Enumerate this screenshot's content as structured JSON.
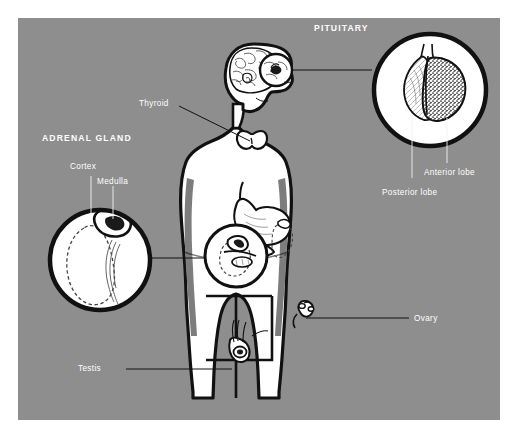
{
  "figure": {
    "panel_color": "#8e8e8e",
    "page_color": "#ffffff",
    "ink_color": "#111111",
    "label_color": "#ffffff",
    "shade_color": "#7d7d7d",
    "panel": {
      "x": 18,
      "y": 18,
      "width": 482,
      "height": 402
    }
  },
  "labels": {
    "pituitary": "PITUITARY",
    "adrenal_gland": "ADRENAL GLAND",
    "thyroid": "Thyroid",
    "cortex": "Cortex",
    "medulla": "Medulla",
    "anterior_lobe": "Anterior lobe",
    "posterior_lobe": "Posterior lobe",
    "ovary": "Ovary",
    "testis": "Testis"
  },
  "callouts": [
    {
      "name": "pituitary-detail",
      "heading": "PITUITARY",
      "sub_labels": [
        "Anterior lobe",
        "Posterior lobe"
      ],
      "circle": {
        "cx": 430,
        "cy": 90,
        "r": 58
      }
    },
    {
      "name": "adrenal-detail",
      "heading": "ADRENAL GLAND",
      "sub_labels": [
        "Cortex",
        "Medulla"
      ],
      "circle": {
        "cx": 100,
        "cy": 260,
        "r": 52
      }
    },
    {
      "name": "pancreas-adrenal-inset",
      "heading": "",
      "sub_labels": [],
      "circle": {
        "cx": 236,
        "cy": 256,
        "r": 32
      }
    },
    {
      "name": "brain-pituitary-marker",
      "heading": "",
      "sub_labels": [],
      "circle": {
        "cx": 276,
        "cy": 70,
        "r": 17
      }
    }
  ],
  "organs": [
    {
      "name": "brain",
      "label": ""
    },
    {
      "name": "pituitary-gland",
      "label": "PITUITARY"
    },
    {
      "name": "thyroid-gland",
      "label": "Thyroid"
    },
    {
      "name": "adrenal-gland",
      "label": "ADRENAL GLAND"
    },
    {
      "name": "adrenal-cortex",
      "label": "Cortex"
    },
    {
      "name": "adrenal-medulla",
      "label": "Medulla"
    },
    {
      "name": "kidney",
      "label": ""
    },
    {
      "name": "stomach",
      "label": ""
    },
    {
      "name": "pancreas",
      "label": ""
    },
    {
      "name": "ovary",
      "label": "Ovary"
    },
    {
      "name": "testis",
      "label": "Testis"
    }
  ]
}
